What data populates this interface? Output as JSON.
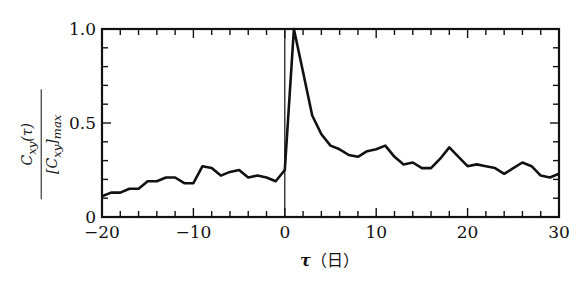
{
  "chart_data": {
    "type": "line",
    "title": "",
    "xlabel": "τ（日）",
    "ylabel": "C_xy(τ) / [C_xy]_max",
    "ylabel_numerator": "C_xy(τ)",
    "ylabel_denominator": "[C_xy]_max",
    "xlim": [
      -20,
      30
    ],
    "ylim": [
      0,
      1.0
    ],
    "x_ticks": [
      -20,
      -10,
      0,
      10,
      20,
      30
    ],
    "x_tick_labels": [
      "−20",
      "−10",
      "0",
      "10",
      "20",
      "30"
    ],
    "y_ticks": [
      0,
      0.5,
      1.0
    ],
    "y_tick_labels": [
      "0",
      "0.5",
      "1.0"
    ],
    "grid": false,
    "reference_line_x": 0,
    "x": [
      -20,
      -19,
      -18,
      -17,
      -16,
      -15,
      -14,
      -13,
      -12,
      -11,
      -10,
      -9,
      -8,
      -7,
      -6,
      -5,
      -4,
      -3,
      -2,
      -1,
      0,
      1,
      2,
      3,
      4,
      5,
      6,
      7,
      8,
      9,
      10,
      11,
      12,
      13,
      14,
      15,
      16,
      17,
      18,
      19,
      20,
      21,
      22,
      23,
      24,
      25,
      26,
      27,
      28,
      29,
      30
    ],
    "values": [
      0.11,
      0.13,
      0.13,
      0.15,
      0.15,
      0.19,
      0.19,
      0.21,
      0.21,
      0.18,
      0.18,
      0.27,
      0.26,
      0.22,
      0.24,
      0.25,
      0.21,
      0.22,
      0.21,
      0.19,
      0.25,
      1.0,
      0.77,
      0.54,
      0.44,
      0.38,
      0.36,
      0.33,
      0.32,
      0.35,
      0.36,
      0.38,
      0.32,
      0.28,
      0.29,
      0.26,
      0.26,
      0.31,
      0.37,
      0.32,
      0.27,
      0.28,
      0.27,
      0.26,
      0.23,
      0.26,
      0.29,
      0.27,
      0.22,
      0.21,
      0.23
    ]
  },
  "labels": {
    "x_axis_symbol": "τ",
    "x_axis_unit": "（日）",
    "y_num": "C",
    "y_num_sub": "xy",
    "y_num_arg": "(τ)",
    "y_den": "[C",
    "y_den_sub": "xy",
    "y_den_close": "]",
    "y_den_sub2": "max"
  }
}
